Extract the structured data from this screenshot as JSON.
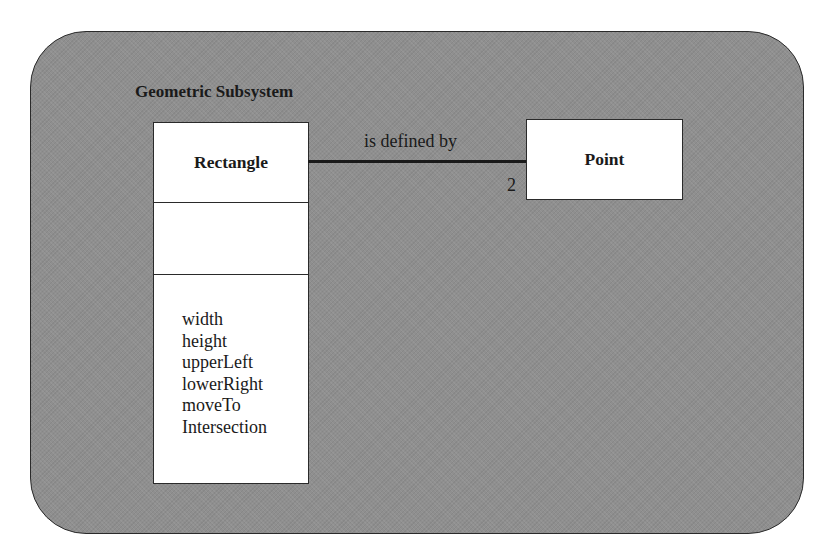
{
  "diagram": {
    "type": "UML class diagram",
    "package": {
      "name": "Geometric Subsystem",
      "fill_color": "#8f8f8f"
    },
    "classes": [
      {
        "name": "Rectangle",
        "attributes": [],
        "operations": [
          "width",
          "height",
          "upperLeft",
          "lowerRight",
          "moveTo",
          "Intersection"
        ]
      },
      {
        "name": "Point",
        "attributes": [],
        "operations": []
      }
    ],
    "associations": [
      {
        "from": "Rectangle",
        "to": "Point",
        "label": "is defined by",
        "multiplicity_to": "2"
      }
    ]
  }
}
